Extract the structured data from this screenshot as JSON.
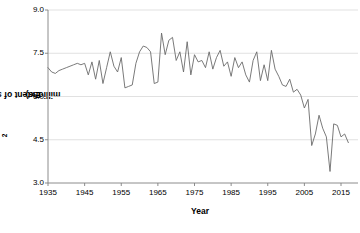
{
  "chart_data": {
    "type": "line",
    "title": "",
    "xlabel": "Year",
    "ylabel": "Extent of sea ice (km²millions)",
    "ylabel_parts": {
      "pre": "Extent of sea ice (km",
      "sup": "2",
      "post": "millions)"
    },
    "xlim": [
      1935,
      2018
    ],
    "ylim": [
      3.0,
      9.0
    ],
    "ytick_labels": [
      "3.0",
      "4.5",
      "6.0",
      "7.5",
      "9.0"
    ],
    "ytick_values": [
      3.0,
      4.5,
      6.0,
      7.5,
      9.0
    ],
    "xtick_labels": [
      "1935",
      "1945",
      "1955",
      "1965",
      "1975",
      "1985",
      "1995",
      "2005",
      "2015"
    ],
    "xtick_values": [
      1935,
      1945,
      1955,
      1965,
      1975,
      1985,
      1995,
      2005,
      2015
    ],
    "grid": "horizontal",
    "legend": "none",
    "line_color": "#6b6b6b",
    "grid_color": "#d9d9d9",
    "axis_color": "#808080",
    "background": "#ffffff",
    "x": [
      1935,
      1936,
      1937,
      1938,
      1939,
      1940,
      1941,
      1942,
      1943,
      1944,
      1945,
      1946,
      1947,
      1948,
      1949,
      1950,
      1951,
      1952,
      1953,
      1954,
      1955,
      1956,
      1957,
      1958,
      1959,
      1960,
      1961,
      1962,
      1963,
      1964,
      1965,
      1966,
      1967,
      1968,
      1969,
      1970,
      1971,
      1972,
      1973,
      1974,
      1975,
      1976,
      1977,
      1978,
      1979,
      1980,
      1981,
      1982,
      1983,
      1984,
      1985,
      1986,
      1987,
      1988,
      1989,
      1990,
      1991,
      1992,
      1993,
      1994,
      1995,
      1996,
      1997,
      1998,
      1999,
      2000,
      2001,
      2002,
      2003,
      2004,
      2005,
      2006,
      2007,
      2008,
      2009,
      2010,
      2011,
      2012,
      2013,
      2014,
      2015,
      2016,
      2017
    ],
    "values": [
      7.0,
      6.85,
      6.8,
      6.9,
      6.95,
      7.0,
      7.05,
      7.1,
      7.15,
      7.1,
      7.15,
      6.75,
      7.2,
      6.6,
      7.25,
      6.45,
      7.0,
      7.55,
      7.05,
      6.85,
      7.35,
      6.3,
      6.35,
      6.4,
      7.15,
      7.55,
      7.75,
      7.7,
      7.55,
      6.45,
      6.5,
      8.2,
      7.45,
      7.95,
      8.05,
      7.25,
      7.55,
      6.85,
      7.9,
      6.75,
      7.45,
      7.2,
      7.25,
      7.0,
      7.55,
      6.95,
      7.35,
      7.6,
      7.05,
      7.2,
      6.7,
      7.35,
      7.0,
      7.2,
      6.75,
      6.5,
      7.25,
      7.55,
      6.55,
      7.1,
      6.55,
      7.6,
      6.95,
      6.7,
      6.4,
      6.35,
      6.6,
      6.15,
      6.25,
      6.05,
      5.6,
      5.9,
      4.3,
      4.7,
      5.35,
      4.9,
      4.6,
      3.4,
      5.05,
      5.0,
      4.6,
      4.7,
      4.4
    ]
  }
}
